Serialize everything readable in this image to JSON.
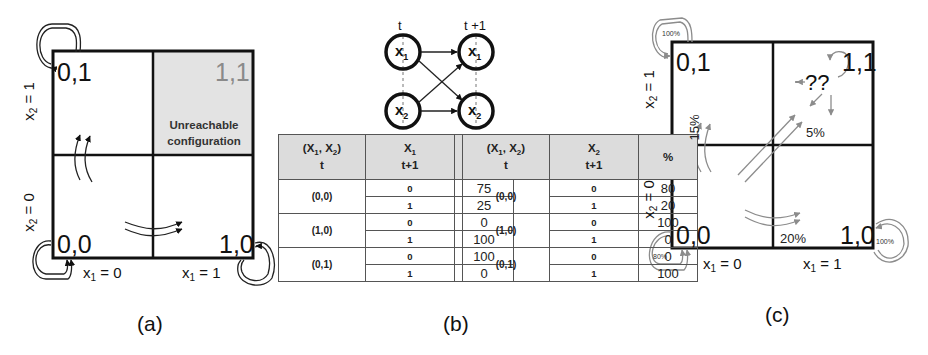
{
  "panel_a": {
    "caption": "(a)",
    "cells": {
      "c00": "0,0",
      "c10": "1,0",
      "c01": "0,1",
      "c11": "1,1"
    },
    "unreachable_label_line1": "Unreachable",
    "unreachable_label_line2": "configuration",
    "x1_axis": [
      "x1 = 0",
      "x1 = 1"
    ],
    "x2_axis": [
      "x2 = 0",
      "x2 = 1"
    ],
    "shaded_cell_color": "#e3e3e3"
  },
  "panel_b": {
    "caption": "(b)",
    "network": {
      "time_labels": [
        "t",
        "t +1"
      ],
      "nodes": [
        "x1",
        "x2"
      ],
      "edges": [
        [
          "x1(t)",
          "x1(t+1)"
        ],
        [
          "x1(t)",
          "x2(t+1)"
        ],
        [
          "x2(t)",
          "x1(t+1)"
        ],
        [
          "x2(t)",
          "x2(t+1)"
        ]
      ]
    },
    "tables": [
      {
        "header": {
          "state": "(X1, X2)",
          "state_sub": "t",
          "var": "X1",
          "var_sub": "t+1",
          "pct": "%"
        },
        "rows": [
          {
            "state": "(0,0)",
            "values": [
              {
                "v": "0",
                "p": "75"
              },
              {
                "v": "1",
                "p": "25"
              }
            ]
          },
          {
            "state": "(1,0)",
            "values": [
              {
                "v": "0",
                "p": "0"
              },
              {
                "v": "1",
                "p": "100"
              }
            ]
          },
          {
            "state": "(0,1)",
            "values": [
              {
                "v": "0",
                "p": "100"
              },
              {
                "v": "1",
                "p": "0"
              }
            ]
          }
        ]
      },
      {
        "header": {
          "state": "(X1, X2)",
          "state_sub": "t",
          "var": "X2",
          "var_sub": "t+1",
          "pct": "%"
        },
        "rows": [
          {
            "state": "(0,0)",
            "values": [
              {
                "v": "0",
                "p": "80"
              },
              {
                "v": "1",
                "p": "20"
              }
            ]
          },
          {
            "state": "(1,0)",
            "values": [
              {
                "v": "0",
                "p": "100"
              },
              {
                "v": "1",
                "p": "0"
              }
            ]
          },
          {
            "state": "(0,1)",
            "values": [
              {
                "v": "0",
                "p": "0"
              },
              {
                "v": "1",
                "p": "100"
              }
            ]
          }
        ]
      }
    ]
  },
  "panel_c": {
    "caption": "(c)",
    "cells": {
      "c00": "0,0",
      "c10": "1,0",
      "c01": "0,1",
      "c11": "1,1"
    },
    "unknown_label": "??",
    "percent_labels": {
      "self_00": "80%",
      "self_01": "100%",
      "self_10": "100%",
      "to_01": "15%",
      "to_10": "20%",
      "to_11": "5%"
    },
    "x1_axis": [
      "x1 = 0",
      "x1 = 1"
    ],
    "x2_axis": [
      "x2 = 0",
      "x2 = 1"
    ],
    "arrow_color": "#8c8c8c"
  }
}
